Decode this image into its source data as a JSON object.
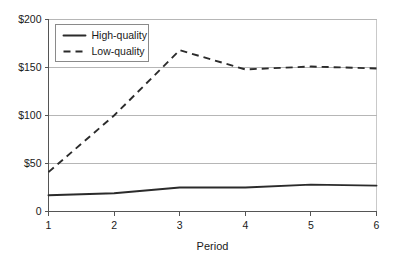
{
  "chart_data": {
    "type": "line",
    "title": "",
    "xlabel": "Period",
    "ylabel": "",
    "x": [
      1,
      2,
      3,
      4,
      5,
      6
    ],
    "categories": [
      "1",
      "2",
      "3",
      "4",
      "5",
      "6"
    ],
    "xtick_labels": [
      "1",
      "2",
      "3",
      "4",
      "5",
      "6"
    ],
    "ytick_labels": [
      "0",
      "$50",
      "$100",
      "$150",
      "$200"
    ],
    "ytick_values": [
      0,
      50,
      100,
      150,
      200
    ],
    "xlim": [
      1,
      6
    ],
    "ylim": [
      0,
      200
    ],
    "grid": "horizontal",
    "legend_position": "top-left-inside",
    "series": [
      {
        "name": "High-quality",
        "style": "solid",
        "color": "#2b2b2b",
        "values": [
          17,
          19,
          25,
          25,
          28,
          27
        ]
      },
      {
        "name": "Low-quality",
        "style": "dashed",
        "color": "#2b2b2b",
        "values": [
          41,
          100,
          168,
          148,
          151,
          149
        ]
      }
    ]
  },
  "legend": {
    "items": [
      {
        "label": "High-quality",
        "style": "solid"
      },
      {
        "label": "Low-quality",
        "style": "dashed"
      }
    ]
  },
  "axes": {
    "x_title": "Period"
  }
}
